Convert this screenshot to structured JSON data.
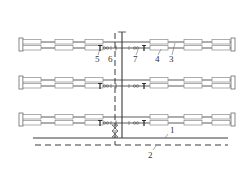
{
  "diagram": {
    "type": "pipe-heating-layout",
    "colors": {
      "line": "#4a4a4a",
      "box_fill": "#ffffff",
      "box_stroke": "#8a8a8a",
      "label": "#333333"
    },
    "rows": [
      {
        "id": "row-1",
        "y": 38
      },
      {
        "id": "row-2",
        "y": 76
      },
      {
        "id": "row-3",
        "y": 113
      }
    ],
    "labels": [
      {
        "id": "label-5",
        "text": "5",
        "x": 96,
        "y": 62
      },
      {
        "id": "label-6",
        "text": "6",
        "x": 109,
        "y": 62
      },
      {
        "id": "label-7",
        "text": "7",
        "x": 134,
        "y": 62
      },
      {
        "id": "label-4",
        "text": "4",
        "x": 156,
        "y": 62
      },
      {
        "id": "label-3",
        "text": "3",
        "x": 170,
        "y": 62
      },
      {
        "id": "label-1",
        "text": "1",
        "x": 172,
        "y": 132
      },
      {
        "id": "label-2",
        "text": "2",
        "x": 150,
        "y": 158
      }
    ]
  }
}
